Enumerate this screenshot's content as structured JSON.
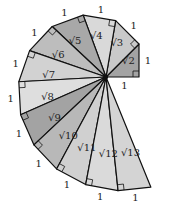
{
  "center": [
    106,
    77
  ],
  "unit_px": 33,
  "stroke_color": "#111111",
  "triangles": [
    {
      "hyp": "√2",
      "leg": "1",
      "fill": "#a3a3a3"
    },
    {
      "hyp": "√3",
      "leg": "1",
      "fill": "#c9c9c9"
    },
    {
      "hyp": "√4",
      "leg": "1",
      "fill": "#d9d9d9"
    },
    {
      "hyp": "√5",
      "leg": "1",
      "fill": "#a8a8a8"
    },
    {
      "hyp": "√6",
      "leg": "1",
      "fill": "#bdbdbd"
    },
    {
      "hyp": "√7",
      "leg": "1",
      "fill": "#d2d2d2"
    },
    {
      "hyp": "√8",
      "leg": "1",
      "fill": "#dedede"
    },
    {
      "hyp": "√9",
      "leg": "1",
      "fill": "#a3a3a3"
    },
    {
      "hyp": "√10",
      "leg": "1",
      "fill": "#b8b8b8"
    },
    {
      "hyp": "√11",
      "leg": "1",
      "fill": "#d0d0d0"
    },
    {
      "hyp": "√12",
      "leg": "1",
      "fill": "#dadada"
    },
    {
      "hyp": "√13",
      "leg": "1",
      "fill": "#d4d4d4"
    }
  ],
  "first_leg_label": "1"
}
